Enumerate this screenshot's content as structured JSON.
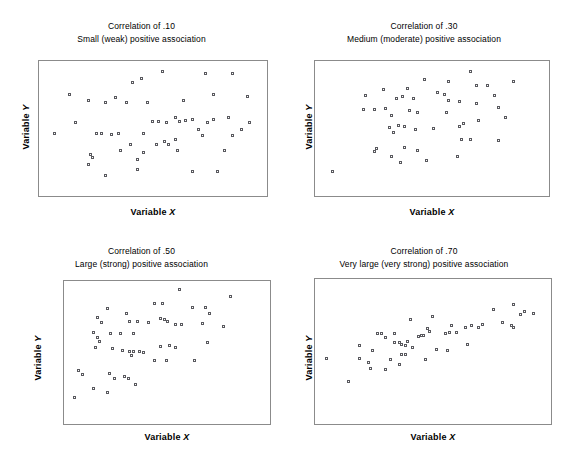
{
  "figure": {
    "background_color": "#ffffff",
    "frame_color": "#8b8b8b",
    "marker_color": "#59595e",
    "panel_count": 4
  },
  "axis_labels": {
    "x_prefix": "Variable ",
    "x_symbol": "X",
    "y_prefix": "Variable ",
    "y_symbol": "Y"
  },
  "panels": [
    {
      "id": "panel-correlation-10",
      "title": "Correlation of .10",
      "subtitle": "Small (weak) positive association",
      "xlabel_prefix": "Variable ",
      "xlabel_symbol": "X",
      "ylabel_prefix": "Variable ",
      "ylabel_symbol": "Y"
    },
    {
      "id": "panel-correlation-30",
      "title": "Correlation of .30",
      "subtitle": "Medium (moderate) positive association",
      "xlabel_prefix": "Variable ",
      "xlabel_symbol": "X",
      "ylabel_prefix": "Variable ",
      "ylabel_symbol": "Y"
    },
    {
      "id": "panel-correlation-50",
      "title": "Correlation of .50",
      "subtitle": "Large (strong) positive association",
      "xlabel_prefix": "Variable ",
      "xlabel_symbol": "X",
      "ylabel_prefix": "Variable ",
      "ylabel_symbol": "Y"
    },
    {
      "id": "panel-correlation-70",
      "title": "Correlation of .70",
      "subtitle": "Very large (very strong) positive association",
      "xlabel_prefix": "Variable ",
      "xlabel_symbol": "X",
      "ylabel_prefix": "Variable ",
      "ylabel_symbol": "Y"
    }
  ],
  "chart_data": [
    {
      "type": "scatter",
      "title": "Correlation of .10",
      "subtitle": "Small (weak) positive association",
      "xlabel": "Variable X",
      "ylabel": "Variable Y",
      "correlation": 0.1,
      "grid": false,
      "legend": null,
      "xlim": [
        0,
        100
      ],
      "ylim": [
        0,
        100
      ],
      "points": [
        [
          55,
          97
        ],
        [
          75,
          95
        ],
        [
          88,
          95
        ],
        [
          41,
          88
        ],
        [
          45,
          91
        ],
        [
          11,
          78
        ],
        [
          20,
          73
        ],
        [
          79,
          78
        ],
        [
          33,
          75
        ],
        [
          28,
          71
        ],
        [
          38,
          71
        ],
        [
          95,
          76
        ],
        [
          65,
          73
        ],
        [
          48,
          71
        ],
        [
          14,
          54
        ],
        [
          50,
          55
        ],
        [
          53,
          55
        ],
        [
          57,
          54
        ],
        [
          61,
          58
        ],
        [
          63,
          55
        ],
        [
          66,
          56
        ],
        [
          69,
          57
        ],
        [
          76,
          54
        ],
        [
          79,
          57
        ],
        [
          86,
          58
        ],
        [
          92,
          48
        ],
        [
          4,
          45
        ],
        [
          24,
          45
        ],
        [
          26,
          45
        ],
        [
          31,
          44
        ],
        [
          34,
          45
        ],
        [
          46,
          45
        ],
        [
          72,
          48
        ],
        [
          74,
          43
        ],
        [
          88,
          43
        ],
        [
          52,
          36
        ],
        [
          56,
          38
        ],
        [
          58,
          36
        ],
        [
          61,
          40
        ],
        [
          40,
          36
        ],
        [
          46,
          29
        ],
        [
          21,
          27
        ],
        [
          22,
          25
        ],
        [
          35,
          31
        ],
        [
          43,
          23
        ],
        [
          62,
          31
        ],
        [
          84,
          31
        ],
        [
          20,
          19
        ],
        [
          43,
          15
        ],
        [
          69,
          13
        ],
        [
          81,
          13
        ],
        [
          28,
          10
        ],
        [
          96,
          54
        ]
      ]
    },
    {
      "type": "scatter",
      "title": "Correlation of .30",
      "subtitle": "Medium (moderate) positive association",
      "xlabel": "Variable X",
      "ylabel": "Variable Y",
      "correlation": 0.3,
      "grid": false,
      "legend": null,
      "xlim": [
        0,
        100
      ],
      "ylim": [
        0,
        100
      ],
      "points": [
        [
          68,
          97
        ],
        [
          47,
          90
        ],
        [
          58,
          89
        ],
        [
          88,
          89
        ],
        [
          71,
          85
        ],
        [
          76,
          85
        ],
        [
          28,
          82
        ],
        [
          39,
          83
        ],
        [
          20,
          77
        ],
        [
          37,
          76
        ],
        [
          53,
          79
        ],
        [
          56,
          78
        ],
        [
          79,
          77
        ],
        [
          34,
          74
        ],
        [
          42,
          74
        ],
        [
          58,
          73
        ],
        [
          63,
          72
        ],
        [
          29,
          66
        ],
        [
          71,
          70
        ],
        [
          81,
          67
        ],
        [
          19,
          65
        ],
        [
          24,
          65
        ],
        [
          40,
          64
        ],
        [
          44,
          63
        ],
        [
          57,
          63
        ],
        [
          32,
          60
        ],
        [
          84,
          58
        ],
        [
          72,
          56
        ],
        [
          31,
          50
        ],
        [
          35,
          52
        ],
        [
          38,
          51
        ],
        [
          43,
          48
        ],
        [
          51,
          49
        ],
        [
          63,
          51
        ],
        [
          65,
          53
        ],
        [
          33,
          46
        ],
        [
          64,
          40
        ],
        [
          68,
          40
        ],
        [
          81,
          39
        ],
        [
          24,
          30
        ],
        [
          25,
          32
        ],
        [
          38,
          33
        ],
        [
          44,
          31
        ],
        [
          32,
          26
        ],
        [
          62,
          26
        ],
        [
          36,
          21
        ],
        [
          48,
          22
        ],
        [
          5,
          13
        ]
      ]
    },
    {
      "type": "scatter",
      "title": "Correlation of .50",
      "subtitle": "Large (strong) positive association",
      "xlabel": "Variable X",
      "ylabel": "Variable Y",
      "correlation": 0.5,
      "grid": false,
      "legend": null,
      "xlim": [
        0,
        100
      ],
      "ylim": [
        0,
        100
      ],
      "points": [
        [
          57,
          99
        ],
        [
          84,
          93
        ],
        [
          44,
          88
        ],
        [
          48,
          88
        ],
        [
          64,
          85
        ],
        [
          71,
          85
        ],
        [
          19,
          84
        ],
        [
          29,
          80
        ],
        [
          73,
          80
        ],
        [
          14,
          77
        ],
        [
          31,
          74
        ],
        [
          35,
          74
        ],
        [
          41,
          73
        ],
        [
          47,
          76
        ],
        [
          49,
          75
        ],
        [
          51,
          74
        ],
        [
          16,
          73
        ],
        [
          55,
          71
        ],
        [
          58,
          71
        ],
        [
          69,
          72
        ],
        [
          80,
          70
        ],
        [
          12,
          65
        ],
        [
          21,
          64
        ],
        [
          26,
          64
        ],
        [
          33,
          64
        ],
        [
          14,
          61
        ],
        [
          15,
          58
        ],
        [
          72,
          57
        ],
        [
          47,
          54
        ],
        [
          52,
          55
        ],
        [
          55,
          53
        ],
        [
          13,
          53
        ],
        [
          22,
          52
        ],
        [
          27,
          51
        ],
        [
          31,
          50
        ],
        [
          33,
          50
        ],
        [
          32,
          47
        ],
        [
          36,
          50
        ],
        [
          38,
          49
        ],
        [
          44,
          43
        ],
        [
          50,
          43
        ],
        [
          65,
          43
        ],
        [
          4,
          35
        ],
        [
          6,
          32
        ],
        [
          20,
          33
        ],
        [
          23,
          29
        ],
        [
          28,
          30
        ],
        [
          30,
          29
        ],
        [
          34,
          24
        ],
        [
          12,
          21
        ],
        [
          19,
          18
        ],
        [
          2,
          14
        ]
      ]
    },
    {
      "type": "scatter",
      "title": "Correlation of .70",
      "subtitle": "Very large (very strong) positive association",
      "xlabel": "Variable X",
      "ylabel": "Variable Y",
      "correlation": 0.7,
      "grid": false,
      "legend": null,
      "xlim": [
        0,
        100
      ],
      "ylim": [
        0,
        100
      ],
      "points": [
        [
          87,
          86
        ],
        [
          78,
          82
        ],
        [
          92,
          80
        ],
        [
          96,
          79
        ],
        [
          90,
          78
        ],
        [
          40,
          74
        ],
        [
          50,
          76
        ],
        [
          82,
          72
        ],
        [
          73,
          70
        ],
        [
          86,
          69
        ],
        [
          87,
          68
        ],
        [
          59,
          69
        ],
        [
          65,
          68
        ],
        [
          68,
          69
        ],
        [
          71,
          68
        ],
        [
          48,
          67
        ],
        [
          49,
          65
        ],
        [
          25,
          63
        ],
        [
          27,
          63
        ],
        [
          33,
          63
        ],
        [
          46,
          62
        ],
        [
          56,
          63
        ],
        [
          58,
          64
        ],
        [
          61,
          64
        ],
        [
          44,
          61
        ],
        [
          45,
          62
        ],
        [
          29,
          60
        ],
        [
          17,
          54
        ],
        [
          33,
          56
        ],
        [
          35,
          56
        ],
        [
          36,
          55
        ],
        [
          38,
          54
        ],
        [
          39,
          57
        ],
        [
          66,
          55
        ],
        [
          41,
          52
        ],
        [
          23,
          50
        ],
        [
          52,
          51
        ],
        [
          57,
          50
        ],
        [
          36,
          47
        ],
        [
          38,
          47
        ],
        [
          2,
          44
        ],
        [
          17,
          44
        ],
        [
          21,
          41
        ],
        [
          31,
          43
        ],
        [
          47,
          43
        ],
        [
          35,
          39
        ],
        [
          22,
          36
        ],
        [
          29,
          35
        ],
        [
          12,
          26
        ]
      ]
    }
  ]
}
